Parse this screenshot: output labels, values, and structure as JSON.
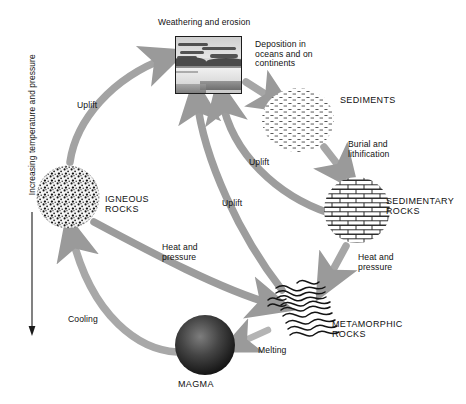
{
  "diagram": {
    "axis": {
      "caption": "Increasing temperature and pressure",
      "direction": "down",
      "arrow_icon": "down-arrow-icon"
    },
    "colors": {
      "arrow_gray": "#9a9a9a",
      "arrow_gray_dark": "#7e7e7e",
      "ink": "#1a1a1a",
      "magma_dark": "#2b2b2b",
      "paper": "#ffffff"
    },
    "nodes": [
      {
        "id": "weathering",
        "label": "Weathering and erosion",
        "icon": "landscape-photo-icon",
        "type": "photo"
      },
      {
        "id": "sediments",
        "label": "SEDIMENTS",
        "icon": "stippled-sediment-icon",
        "type": "material"
      },
      {
        "id": "sedimentary",
        "label": "SEDIMENTARY\nROCKS",
        "icon": "brick-pattern-icon",
        "type": "material"
      },
      {
        "id": "metamorphic",
        "label": "METAMORPHIC\nROCKS",
        "icon": "folded-bands-icon",
        "type": "material"
      },
      {
        "id": "magma",
        "label": "MAGMA",
        "icon": "molten-sphere-icon",
        "type": "material"
      },
      {
        "id": "igneous",
        "label": "IGNEOUS\nROCKS",
        "icon": "speckled-crystal-icon",
        "type": "material"
      }
    ],
    "processes": [
      {
        "id": "deposition",
        "label": "Deposition in\noceans and on\ncontinents",
        "from": "weathering",
        "to": "sediments"
      },
      {
        "id": "burial",
        "label": "Burial and\nlithification",
        "from": "sediments",
        "to": "sedimentary"
      },
      {
        "id": "heat-pressure-1",
        "label": "Heat and\npressure",
        "from": "sedimentary",
        "to": "metamorphic"
      },
      {
        "id": "melting",
        "label": "Melting",
        "from": "metamorphic",
        "to": "magma"
      },
      {
        "id": "cooling",
        "label": "Cooling",
        "from": "magma",
        "to": "igneous"
      },
      {
        "id": "heat-pressure-2",
        "label": "Heat and\npressure",
        "from": "igneous",
        "to": "metamorphic"
      },
      {
        "id": "uplift-1",
        "label": "Uplift",
        "from": "igneous",
        "to": "weathering"
      },
      {
        "id": "uplift-2",
        "label": "Uplift",
        "from": "metamorphic",
        "to": "weathering"
      },
      {
        "id": "uplift-3",
        "label": "Uplift",
        "from": "sedimentary",
        "to": "weathering"
      }
    ]
  }
}
